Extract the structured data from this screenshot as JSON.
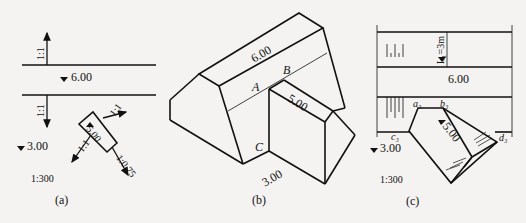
{
  "figure": {
    "panel_a": {
      "caption": "(a)",
      "scale": "1:300",
      "elevations": {
        "top": "6.00",
        "left_low": "3.00",
        "ramp": "5.00"
      },
      "slopes": {
        "upper": "1:1",
        "lower": "1:1",
        "ramp_left": "1:1",
        "ramp_right": "1:1",
        "ramp_end": "1:0.75"
      }
    },
    "panel_b": {
      "caption": "(b)",
      "dims": {
        "top": "6.00",
        "ramp": "5.00",
        "base": "3.00"
      },
      "points": {
        "a": "A",
        "b": "B",
        "c": "C"
      }
    },
    "panel_c": {
      "caption": "(c)",
      "scale": "1:300",
      "length_label": "L₁=3m",
      "elevations": {
        "top": "6.00",
        "left_low": "3.00",
        "ramp": "5.00"
      },
      "points": {
        "a": "a₃",
        "b": "b₃",
        "c": "c₃",
        "d": "d₃"
      }
    },
    "colors": {
      "ink": "#111111",
      "paper": "#f4f3f1"
    }
  }
}
